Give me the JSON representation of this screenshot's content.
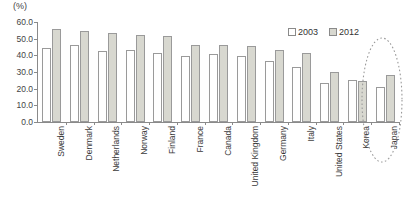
{
  "chart_data": {
    "type": "bar",
    "title": "",
    "subtitle": "",
    "unit_label": "(%)",
    "xlabel": "",
    "ylabel": "",
    "ylim": [
      0.0,
      60.0
    ],
    "ytick_step": 10.0,
    "yticks": [
      "0.0",
      "10.0",
      "20.0",
      "30.0",
      "40.0",
      "50.0",
      "60.0"
    ],
    "grid": false,
    "legend_position": "top-right",
    "categories": [
      "Sweden",
      "Denmark",
      "Netherlands",
      "Norway",
      "Finland",
      "France",
      "Canada",
      "United Kingdom",
      "Germany",
      "Italy",
      "United States",
      "Korea",
      "Japan"
    ],
    "series": [
      {
        "name": "2003",
        "color": "#ffffff",
        "values": [
          44.5,
          46.5,
          42.5,
          43.0,
          41.5,
          39.5,
          41.0,
          39.5,
          36.5,
          33.0,
          23.5,
          25.0,
          21.0
        ]
      },
      {
        "name": "2012",
        "color": "#d8d8d0",
        "values": [
          56.0,
          54.5,
          53.5,
          52.5,
          51.5,
          46.5,
          46.0,
          45.5,
          43.0,
          41.5,
          30.0,
          24.5,
          28.0
        ]
      }
    ],
    "annotations": [
      {
        "kind": "ellipse-highlight",
        "target_category": "Japan",
        "style": "dashed",
        "color": "#9a9a9a"
      }
    ]
  },
  "legend": {
    "items": [
      {
        "label": "2003",
        "swatch": "open-square-swatch"
      },
      {
        "label": "2012",
        "swatch": "filled-square-swatch"
      }
    ]
  }
}
